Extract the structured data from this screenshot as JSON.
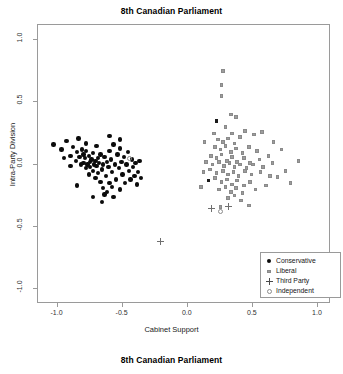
{
  "figure": {
    "title_top": "8th Canadian Parliament",
    "title_bottom": "8th Canadian Parliament"
  },
  "chart_data": {
    "type": "scatter",
    "title": "8th Canadian Parliament",
    "caption": "8th Canadian Parliament",
    "xlabel": "Cabinet Support",
    "ylabel": "Intra-Party Division",
    "xlim": [
      -1.15,
      1.1
    ],
    "ylim": [
      -1.12,
      1.12
    ],
    "xticks": [
      -1.0,
      -0.5,
      0.0,
      0.5,
      1.0
    ],
    "xticklabels": [
      "-1.0",
      "-0.5",
      "0.0",
      "0.5",
      "1.0"
    ],
    "yticks": [
      -1.0,
      -0.5,
      0.0,
      0.5,
      1.0
    ],
    "yticklabels": [
      "-1.0",
      "-0.5",
      "0.0",
      "0.5",
      "1.0"
    ],
    "grid": false,
    "legend_position": "bottom-right",
    "colors": {
      "conservative": "#0b0b0b",
      "liberal": "#9d9d9d",
      "third_party": "#6f6f6f",
      "independent": "#8d8d8d",
      "frame": "#9a9a9a",
      "background": "#ffffff"
    },
    "series": [
      {
        "name": "Conservative",
        "marker": "filled-circle",
        "color": "#0b0b0b",
        "points": [
          [
            -1.03,
            0.16
          ],
          [
            -0.97,
            0.12
          ],
          [
            -0.93,
            0.19
          ],
          [
            -0.9,
            0.07
          ],
          [
            -0.88,
            0.14
          ],
          [
            -0.86,
            0.03
          ],
          [
            -0.85,
            0.1
          ],
          [
            -0.84,
            0.21
          ],
          [
            -0.83,
            0.06
          ],
          [
            -0.82,
            0.0
          ],
          [
            -0.81,
            0.12
          ],
          [
            -0.8,
            0.08
          ],
          [
            -0.8,
            0.01
          ],
          [
            -0.79,
            0.05
          ],
          [
            -0.78,
            0.11
          ],
          [
            -0.78,
            -0.03
          ],
          [
            -0.77,
            0.0
          ],
          [
            -0.76,
            0.07
          ],
          [
            -0.76,
            -0.08
          ],
          [
            -0.75,
            0.02
          ],
          [
            -0.75,
            -0.02
          ],
          [
            -0.74,
            0.04
          ],
          [
            -0.73,
            -0.05
          ],
          [
            -0.73,
            0.09
          ],
          [
            -0.72,
            0.0
          ],
          [
            -0.71,
            -0.11
          ],
          [
            -0.71,
            0.03
          ],
          [
            -0.7,
            -0.01
          ],
          [
            -0.69,
            0.05
          ],
          [
            -0.69,
            -0.07
          ],
          [
            -0.68,
            0.01
          ],
          [
            -0.67,
            -0.14
          ],
          [
            -0.67,
            0.08
          ],
          [
            -0.66,
            -0.04
          ],
          [
            -0.65,
            0.0
          ],
          [
            -0.65,
            -0.19
          ],
          [
            -0.64,
            0.06
          ],
          [
            -0.63,
            -0.09
          ],
          [
            -0.62,
            0.02
          ],
          [
            -0.62,
            -0.22
          ],
          [
            -0.61,
            -0.02
          ],
          [
            -0.6,
            0.11
          ],
          [
            -0.6,
            -0.15
          ],
          [
            -0.59,
            0.04
          ],
          [
            -0.58,
            -0.06
          ],
          [
            -0.57,
            0.16
          ],
          [
            -0.57,
            -0.26
          ],
          [
            -0.56,
            0.0
          ],
          [
            -0.55,
            -0.12
          ],
          [
            -0.54,
            0.08
          ],
          [
            -0.53,
            -0.03
          ],
          [
            -0.52,
            0.13
          ],
          [
            -0.52,
            -0.2
          ],
          [
            -0.51,
            0.02
          ],
          [
            -0.5,
            -0.08
          ],
          [
            -0.49,
            0.06
          ],
          [
            -0.48,
            -0.15
          ],
          [
            -0.47,
            0.0
          ],
          [
            -0.46,
            0.1
          ],
          [
            -0.45,
            -0.05
          ],
          [
            -0.44,
            -0.12
          ],
          [
            -0.43,
            0.04
          ],
          [
            -0.42,
            -0.02
          ],
          [
            -0.41,
            -0.09
          ],
          [
            -0.4,
            0.01
          ],
          [
            -0.39,
            -0.16
          ],
          [
            -0.38,
            -0.06
          ],
          [
            -0.37,
            0.03
          ],
          [
            -0.36,
            -0.11
          ],
          [
            -0.66,
            -0.3
          ],
          [
            -0.73,
            -0.26
          ],
          [
            -0.85,
            -0.17
          ],
          [
            -0.9,
            -0.01
          ],
          [
            -0.95,
            0.05
          ],
          [
            -0.6,
            0.23
          ],
          [
            -0.52,
            0.2
          ],
          [
            -0.78,
            0.17
          ],
          [
            -0.7,
            0.15
          ],
          [
            -0.64,
            -0.24
          ],
          [
            -0.58,
            -0.18
          ]
        ]
      },
      {
        "name": "Liberal",
        "marker": "square",
        "color": "#9d9d9d",
        "points": [
          [
            0.27,
            0.75
          ],
          [
            0.26,
            0.64
          ],
          [
            0.26,
            0.55
          ],
          [
            0.33,
            0.4
          ],
          [
            0.37,
            0.38
          ],
          [
            0.2,
            0.25
          ],
          [
            0.29,
            0.3
          ],
          [
            0.34,
            0.25
          ],
          [
            0.44,
            0.27
          ],
          [
            0.23,
            0.2
          ],
          [
            0.27,
            0.18
          ],
          [
            0.31,
            0.21
          ],
          [
            0.36,
            0.17
          ],
          [
            0.4,
            0.22
          ],
          [
            0.51,
            0.24
          ],
          [
            0.57,
            0.26
          ],
          [
            0.21,
            0.14
          ],
          [
            0.25,
            0.12
          ],
          [
            0.29,
            0.15
          ],
          [
            0.33,
            0.1
          ],
          [
            0.37,
            0.13
          ],
          [
            0.42,
            0.09
          ],
          [
            0.47,
            0.14
          ],
          [
            0.53,
            0.11
          ],
          [
            0.18,
            0.07
          ],
          [
            0.22,
            0.05
          ],
          [
            0.26,
            0.08
          ],
          [
            0.3,
            0.03
          ],
          [
            0.34,
            0.06
          ],
          [
            0.38,
            0.02
          ],
          [
            0.43,
            0.05
          ],
          [
            0.48,
            0.01
          ],
          [
            0.55,
            0.04
          ],
          [
            0.62,
            0.07
          ],
          [
            0.14,
            0.02
          ],
          [
            0.19,
            0.0
          ],
          [
            0.24,
            0.02
          ],
          [
            0.28,
            -0.01
          ],
          [
            0.32,
            0.01
          ],
          [
            0.36,
            -0.02
          ],
          [
            0.4,
            0.0
          ],
          [
            0.45,
            -0.03
          ],
          [
            0.5,
            0.0
          ],
          [
            0.58,
            -0.02
          ],
          [
            0.65,
            0.01
          ],
          [
            0.12,
            -0.06
          ],
          [
            0.17,
            -0.04
          ],
          [
            0.22,
            -0.07
          ],
          [
            0.27,
            -0.05
          ],
          [
            0.31,
            -0.08
          ],
          [
            0.35,
            -0.06
          ],
          [
            0.39,
            -0.09
          ],
          [
            0.44,
            -0.05
          ],
          [
            0.49,
            -0.08
          ],
          [
            0.56,
            -0.06
          ],
          [
            0.63,
            -0.09
          ],
          [
            0.16,
            -0.13
          ],
          [
            0.21,
            -0.11
          ],
          [
            0.26,
            -0.14
          ],
          [
            0.3,
            -0.12
          ],
          [
            0.34,
            -0.16
          ],
          [
            0.38,
            -0.13
          ],
          [
            0.43,
            -0.17
          ],
          [
            0.48,
            -0.14
          ],
          [
            0.24,
            -0.2
          ],
          [
            0.29,
            -0.18
          ],
          [
            0.33,
            -0.22
          ],
          [
            0.37,
            -0.19
          ],
          [
            0.42,
            -0.23
          ],
          [
            0.52,
            -0.2
          ],
          [
            0.6,
            -0.17
          ],
          [
            0.31,
            -0.27
          ],
          [
            0.36,
            -0.25
          ],
          [
            0.41,
            -0.29
          ],
          [
            0.69,
            -0.1
          ],
          [
            0.75,
            -0.05
          ],
          [
            0.79,
            -0.15
          ],
          [
            0.85,
            0.03
          ],
          [
            0.72,
            0.12
          ],
          [
            0.66,
            0.18
          ],
          [
            0.25,
            -0.34
          ],
          [
            0.47,
            -0.33
          ],
          [
            0.13,
            0.18
          ],
          [
            0.1,
            -0.18
          ]
        ]
      },
      {
        "name": "Liberal (dark)",
        "marker": "square",
        "color": "#1a1a1a",
        "points": [
          [
            0.22,
            0.35
          ],
          [
            0.16,
            -0.13
          ]
        ]
      },
      {
        "name": "Third Party",
        "marker": "plus",
        "color": "#6f6f6f",
        "points": [
          [
            -0.21,
            -0.62
          ],
          [
            0.18,
            -0.35
          ],
          [
            0.31,
            -0.34
          ]
        ]
      },
      {
        "name": "Independent",
        "marker": "open-circle",
        "color": "#8d8d8d",
        "points": [
          [
            -0.45,
            0.05
          ],
          [
            0.25,
            -0.38
          ]
        ]
      }
    ],
    "legend": [
      {
        "label": "Conservative",
        "marker": "filled-circle"
      },
      {
        "label": "Liberal",
        "marker": "square"
      },
      {
        "label": "Third Party",
        "marker": "plus"
      },
      {
        "label": "Independent",
        "marker": "open-circle"
      }
    ]
  }
}
